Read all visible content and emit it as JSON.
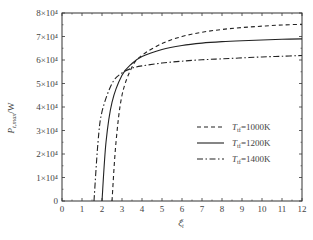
{
  "chart_data": {
    "type": "line",
    "title": "",
    "xlabel": "ξ_t^x",
    "ylabel": "P_t,max/W",
    "xlim": [
      0,
      12
    ],
    "ylim": [
      0,
      80000
    ],
    "x_ticks": [
      "0",
      "1",
      "2",
      "3",
      "4",
      "5",
      "6",
      "7",
      "8",
      "9",
      "10",
      "11",
      "12"
    ],
    "y_ticks": [
      "0",
      "1×10⁴",
      "2×10⁴",
      "3×10⁴",
      "4×10⁴",
      "5×10⁴",
      "6×10⁴",
      "7×10⁴",
      "8×10⁴"
    ],
    "grid": false,
    "legend_position": "lower right",
    "series": [
      {
        "name": "T_tf=1000K",
        "style": "dashed",
        "x": [
          2.5,
          2.7,
          3.0,
          3.5,
          4.0,
          5.0,
          6.0,
          7.0,
          8.0,
          9.0,
          10.0,
          11.0,
          12.0
        ],
        "values": [
          0,
          25000,
          45000,
          57000,
          62000,
          67000,
          70000,
          71800,
          73000,
          73800,
          74400,
          74900,
          75200
        ]
      },
      {
        "name": "T_tf=1200K",
        "style": "solid",
        "x": [
          2.0,
          2.2,
          2.5,
          3.0,
          3.5,
          4.0,
          5.0,
          6.0,
          7.0,
          8.0,
          9.0,
          10.0,
          11.0,
          12.0
        ],
        "values": [
          0,
          25000,
          42000,
          53500,
          58500,
          61500,
          64500,
          66200,
          67200,
          67800,
          68200,
          68500,
          68800,
          69000
        ]
      },
      {
        "name": "T_tf=1400K",
        "style": "dashdot",
        "x": [
          1.6,
          1.8,
          2.0,
          2.5,
          3.0,
          3.5,
          4.0,
          5.0,
          6.0,
          7.0,
          8.0,
          9.0,
          10.0,
          11.0,
          12.0
        ],
        "values": [
          0,
          25000,
          38000,
          50000,
          54500,
          56500,
          57500,
          58700,
          59500,
          60100,
          60500,
          60900,
          61300,
          61600,
          61900
        ]
      }
    ]
  },
  "labels": {
    "ylabel_main": "P",
    "ylabel_sub": "t,max",
    "ylabel_unit": "/W",
    "xlabel_main": "ξ",
    "xlabel_sub": "t",
    "xlabel_sup": "x",
    "legend": [
      {
        "main": "T",
        "sub": "tf",
        "rest": "=1000K"
      },
      {
        "main": "T",
        "sub": "tf",
        "rest": "=1200K"
      },
      {
        "main": "T",
        "sub": "tf",
        "rest": "=1400K"
      }
    ]
  }
}
